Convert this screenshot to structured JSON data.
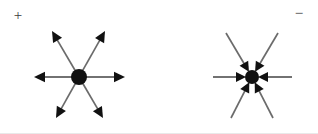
{
  "figure": {
    "background_color": "#ffffff",
    "width": 318,
    "height": 134,
    "line_color": "#6b6b6b",
    "arrow_color": "#111111",
    "label_color": "#3b3b3b"
  },
  "charges": [
    {
      "id": "positive",
      "sign_label": "+",
      "sign_label_x": 18,
      "sign_label_y": 17,
      "field_direction": "outward",
      "center_x": 79,
      "center_y": 77,
      "dot_radius": 8,
      "rays": [
        {
          "name": "ray-west",
          "angle_deg": 180,
          "tip_x": 34,
          "tip_y": 77
        },
        {
          "name": "ray-east",
          "angle_deg": 0,
          "tip_x": 125,
          "tip_y": 77
        },
        {
          "name": "ray-northwest",
          "angle_deg": 209,
          "tip_x": 52,
          "tip_y": 31
        },
        {
          "name": "ray-northeast",
          "angle_deg": 331,
          "tip_x": 105,
          "tip_y": 31
        },
        {
          "name": "ray-southwest",
          "angle_deg": 151,
          "tip_x": 56,
          "tip_y": 118
        },
        {
          "name": "ray-southeast",
          "angle_deg": 29,
          "tip_x": 103,
          "tip_y": 118
        }
      ]
    },
    {
      "id": "negative",
      "sign_label": "−",
      "sign_label_x": 299,
      "sign_label_y": 15,
      "field_direction": "inward",
      "center_x": 252,
      "center_y": 77,
      "dot_radius": 7,
      "rays": [
        {
          "name": "ray-west",
          "angle_deg": 180,
          "tip_x": 213,
          "tip_y": 77
        },
        {
          "name": "ray-east",
          "angle_deg": 0,
          "tip_x": 292,
          "tip_y": 77
        },
        {
          "name": "ray-northwest",
          "angle_deg": 209,
          "tip_x": 226,
          "tip_y": 33
        },
        {
          "name": "ray-northeast",
          "angle_deg": 331,
          "tip_x": 278,
          "tip_y": 33
        },
        {
          "name": "ray-southwest",
          "angle_deg": 151,
          "tip_x": 231,
          "tip_y": 118
        },
        {
          "name": "ray-southeast",
          "angle_deg": 29,
          "tip_x": 273,
          "tip_y": 118
        }
      ]
    }
  ]
}
